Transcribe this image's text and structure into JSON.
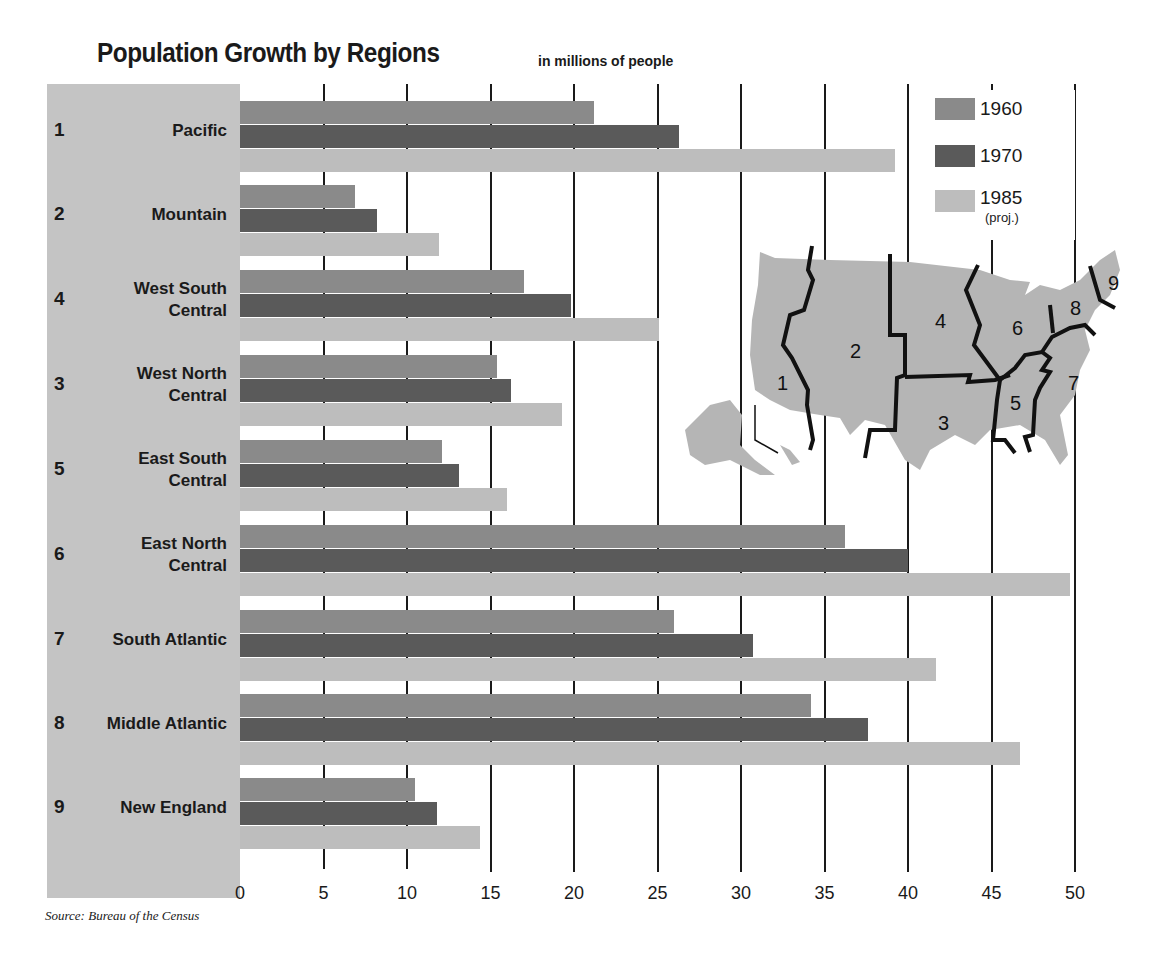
{
  "title": "Population Growth by Regions",
  "subtitle": "in millions of people",
  "source": "Source: Bureau of the Census",
  "legend": {
    "items": [
      {
        "label": "1960",
        "color": "#8a8a8a"
      },
      {
        "label": "1970",
        "color": "#5a5a5a"
      },
      {
        "label": "1985",
        "note": "(proj.)",
        "color": "#bdbdbd"
      }
    ]
  },
  "x_ticks": [
    "0",
    "5",
    "10",
    "15",
    "20",
    "25",
    "30",
    "35",
    "40",
    "45",
    "50"
  ],
  "rows": [
    {
      "num": "1",
      "label": "Pacific"
    },
    {
      "num": "2",
      "label": "Mountain"
    },
    {
      "num": "4",
      "label": "West South\nCentral"
    },
    {
      "num": "3",
      "label": "West North\nCentral"
    },
    {
      "num": "5",
      "label": "East South\nCentral"
    },
    {
      "num": "6",
      "label": "East North\nCentral"
    },
    {
      "num": "7",
      "label": "South Atlantic"
    },
    {
      "num": "8",
      "label": "Middle Atlantic"
    },
    {
      "num": "9",
      "label": "New England"
    }
  ],
  "map": {
    "region_labels": [
      "1",
      "2",
      "3",
      "4",
      "5",
      "6",
      "7",
      "8",
      "9"
    ]
  },
  "chart_data": {
    "type": "bar",
    "orientation": "horizontal",
    "title": "Population Growth by Regions",
    "subtitle": "in millions of people",
    "xlabel": "",
    "ylabel": "",
    "xlim": [
      0,
      50
    ],
    "x_ticks": [
      0,
      5,
      10,
      15,
      20,
      25,
      30,
      35,
      40,
      45,
      50
    ],
    "grid": true,
    "legend_position": "upper right",
    "categories": [
      "1 Pacific",
      "2 Mountain",
      "4 West South Central",
      "3 West North Central",
      "5 East South Central",
      "6 East North Central",
      "7 South Atlantic",
      "8 Middle Atlantic",
      "9 New England"
    ],
    "series": [
      {
        "name": "1960",
        "values": [
          21.2,
          6.9,
          17.0,
          15.4,
          12.1,
          36.2,
          26.0,
          34.2,
          10.5
        ]
      },
      {
        "name": "1970",
        "values": [
          26.3,
          8.2,
          19.8,
          16.2,
          13.1,
          40.0,
          30.7,
          37.6,
          11.8
        ]
      },
      {
        "name": "1985 (proj.)",
        "values": [
          39.2,
          11.9,
          25.1,
          19.3,
          16.0,
          49.7,
          41.7,
          46.7,
          14.4
        ]
      }
    ],
    "annotations": [
      "Source: Bureau of the Census",
      "Inset map of U.S. census regions numbered 1-9"
    ]
  }
}
